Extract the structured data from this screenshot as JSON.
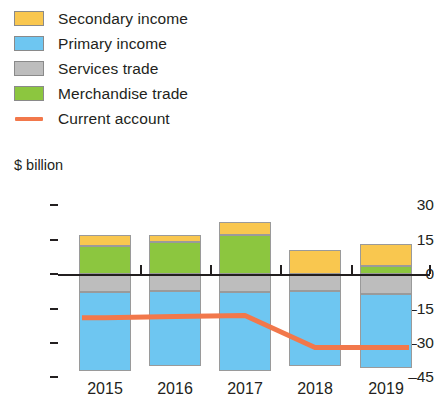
{
  "legend": {
    "items": [
      {
        "label": "Secondary income",
        "color": "#f9c council",
        "swatch": "secondary-income-swatch"
      },
      {
        "label": "Primary income",
        "swatch": "primary-income-swatch"
      },
      {
        "label": "Services trade",
        "swatch": "services-trade-swatch"
      },
      {
        "label": "Merchandise trade",
        "swatch": "merchandise-trade-swatch"
      },
      {
        "label": "Current account",
        "swatch": "current-account-line-swatch"
      }
    ]
  },
  "axis": {
    "y_title": "$ billion",
    "y_ticks": [
      "30",
      "15",
      "0",
      "–15",
      "–30",
      "–45"
    ],
    "x_ticks": [
      "2015",
      "2016",
      "2017",
      "2018",
      "2019"
    ]
  },
  "colors": {
    "secondary_income": "#fbc02d",
    "secondary_income_fill": "#f9c74f",
    "primary_income": "#6ec6f1",
    "services_trade": "#bdbdbd",
    "merchandise_trade": "#8cc63f",
    "current_account": "#f2784b",
    "axis": "#231f20",
    "bar_border": "#9a9a9a"
  },
  "chart_data": {
    "type": "bar",
    "title": "",
    "subtitle": "",
    "xlabel": "",
    "ylabel": "$ billion",
    "ylim": [
      -45,
      30
    ],
    "yticks": [
      30,
      15,
      0,
      -15,
      -30,
      -45
    ],
    "grid": false,
    "legend_position": "top-left",
    "stacked": true,
    "categories": [
      "2015",
      "2016",
      "2017",
      "2018",
      "2019"
    ],
    "series": [
      {
        "name": "Secondary income",
        "color": "#f9c74f",
        "values": [
          5,
          3,
          5.5,
          10.5,
          9.5
        ]
      },
      {
        "name": "Merchandise trade",
        "color": "#8cc63f",
        "values": [
          12,
          14,
          17,
          0,
          3.5
        ]
      },
      {
        "name": "Services trade",
        "color": "#bdbdbd",
        "values": [
          -8,
          -7.5,
          -8,
          -7.5,
          -8.5
        ]
      },
      {
        "name": "Primary income",
        "color": "#6ec6f1",
        "values": [
          -34,
          -32.5,
          -34,
          -32.5,
          -32.5
        ]
      }
    ],
    "line_series": [
      {
        "name": "Current account",
        "color": "#f2784b",
        "values": [
          -19,
          -18.5,
          -18,
          -32,
          -32
        ]
      }
    ]
  },
  "plot_geometry": {
    "zero_y": 274,
    "px_per_unit": 2.3,
    "bar_width": 52,
    "bar_centers": [
      105,
      175,
      245,
      315,
      386
    ]
  }
}
